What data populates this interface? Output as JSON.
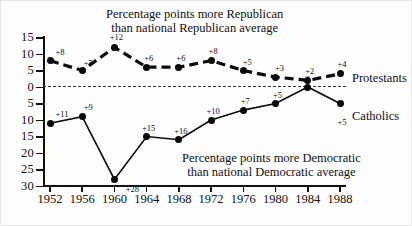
{
  "chart_data": {
    "type": "line",
    "title": "",
    "categories": [
      "1952",
      "1956",
      "1960",
      "1964",
      "1968",
      "1972",
      "1976",
      "1980",
      "1984",
      "1988"
    ],
    "x": [
      1952,
      1956,
      1960,
      1964,
      1968,
      1972,
      1976,
      1980,
      1984,
      1988
    ],
    "xlabel": "",
    "ylabel": "",
    "ylim": [
      -30,
      15
    ],
    "grid": false,
    "legend_position": "right-inline",
    "axis_note": "Y axis is mirrored about zero: values above 0 are labelled 5,10,15 (more Republican); values below 0 are labelled 5,10,15,20,25,30 (more Democratic).",
    "y_tick_labels": [
      "15",
      "10",
      "5",
      "0",
      "5",
      "10",
      "15",
      "20",
      "25",
      "30"
    ],
    "y_tick_values": [
      15,
      10,
      5,
      0,
      -5,
      -10,
      -15,
      -20,
      -25,
      -30
    ],
    "annotations": {
      "top": [
        "Percentage points more Republican",
        "than national Republican average"
      ],
      "bottom": [
        "Percentage points more Democratic",
        "than national Democratic average"
      ]
    },
    "series": [
      {
        "name": "Protestants",
        "style": "dashed",
        "values": [
          8,
          5,
          12,
          6,
          6,
          8,
          5,
          3,
          2,
          4
        ],
        "point_labels": [
          "+8",
          "+5",
          "+12",
          "+6",
          "+6",
          "+8",
          "+5",
          "+3",
          "+2",
          "+4"
        ]
      },
      {
        "name": "Catholics",
        "style": "solid",
        "values": [
          -11,
          -9,
          -28,
          -15,
          -16,
          -10,
          -7,
          -5,
          0,
          -5
        ],
        "point_labels": [
          "+11",
          "+9",
          "+28",
          "+15",
          "+16",
          "+10",
          "+7",
          "+5",
          "0",
          "+5"
        ]
      }
    ]
  },
  "figure": {
    "caption_top_line1": "Percentage points more Republican",
    "caption_top_line2": "than national Republican average",
    "caption_bottom_line1": "Percentage points more Democratic",
    "caption_bottom_line2": "than national Democratic average",
    "series_label_protestants": "Protestants",
    "series_label_catholics": "Catholics"
  }
}
